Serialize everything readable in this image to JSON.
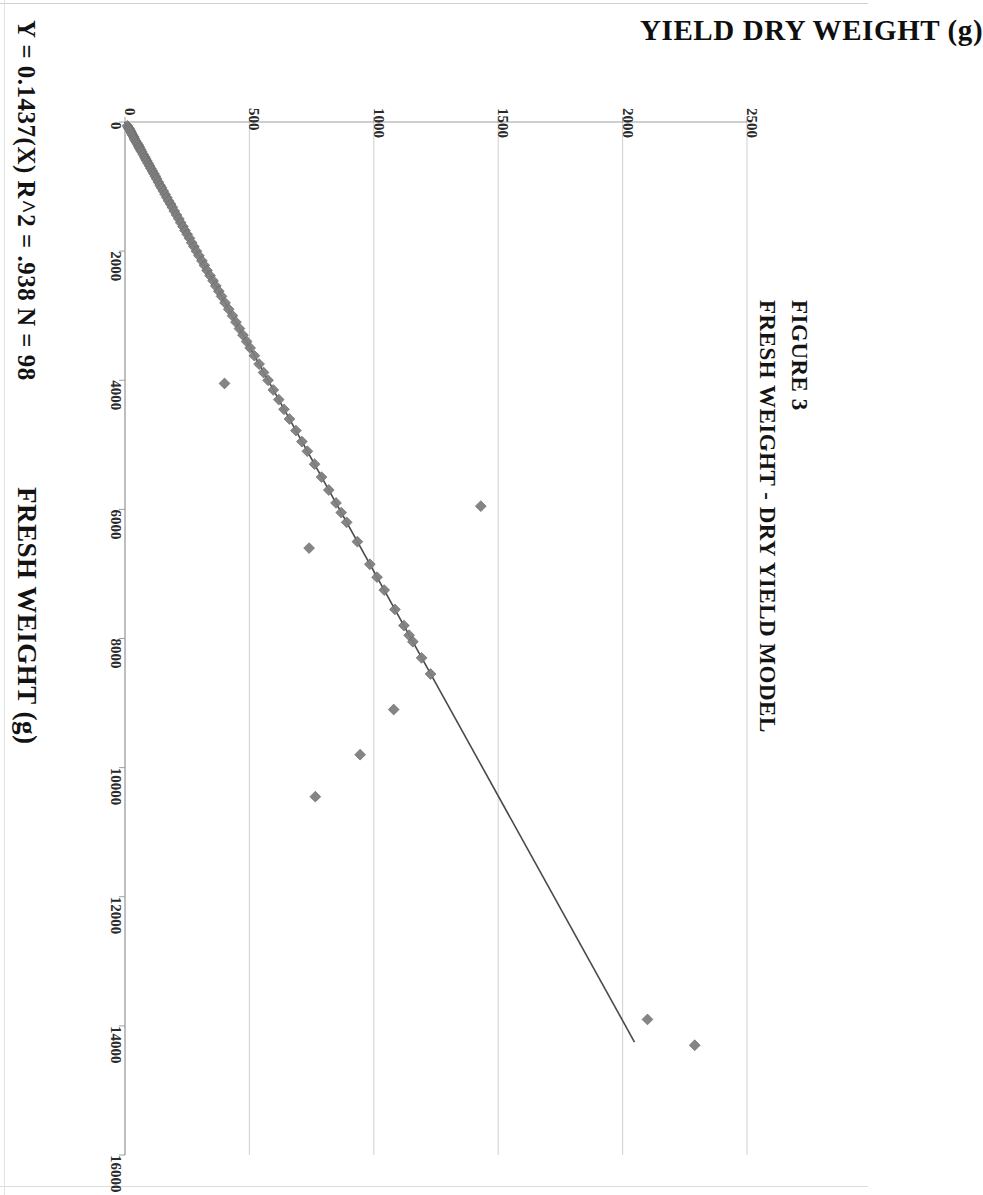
{
  "figure": {
    "number": "FIGURE 3",
    "title": "FRESH WEIGHT - DRY YIELD MODEL"
  },
  "annotation": {
    "equation": "Y = 0.1437(X)",
    "r_squared": "R^2 = .938",
    "n": "N = 98",
    "combined": "Y = 0.1437(X)    R^2 = .938   N = 98"
  },
  "axes": {
    "value_axis_title": "YIELD DRY WEIGHT (g)",
    "category_axis_title": "FRESH WEIGHT (g)",
    "value_ticks": [
      "0",
      "500",
      "1000",
      "1500",
      "2000",
      "2500"
    ],
    "category_ticks": [
      "0",
      "2000",
      "4000",
      "6000",
      "8000",
      "10000",
      "12000",
      "14000",
      "16000"
    ]
  },
  "style": {
    "marker_color": "#7e7e7e",
    "marker_edge": "#6b6b6b",
    "line_color": "#4a4a4a",
    "grid_color": "#c9c9c9",
    "axis_color": "#9e9e9e",
    "background": "#ffffff"
  },
  "chart_data": {
    "type": "scatter",
    "title": "FRESH WEIGHT - DRY YIELD MODEL",
    "subtitle": "FIGURE 3",
    "xlabel": "FRESH WEIGHT (g)",
    "ylabel": "YIELD DRY WEIGHT (g)",
    "xlim": [
      0,
      16000
    ],
    "ylim": [
      0,
      2500
    ],
    "xticks": [
      0,
      2000,
      4000,
      6000,
      8000,
      10000,
      12000,
      14000,
      16000
    ],
    "yticks": [
      0,
      500,
      1000,
      1500,
      2000,
      2500
    ],
    "grid": true,
    "legend": false,
    "orientation": "page-rotated-90-clockwise",
    "annotations": [
      "Y = 0.1437(X)",
      "R^2 = .938",
      "N = 98"
    ],
    "fit_line": {
      "type": "linear-through-origin",
      "slope": 0.1437,
      "intercept": 0,
      "r_squared": 0.938,
      "n": 98,
      "x_start": 0,
      "x_end": 14250
    },
    "series": [
      {
        "name": "samples",
        "n": 98,
        "x": [
          60,
          90,
          110,
          140,
          170,
          200,
          230,
          260,
          290,
          320,
          350,
          380,
          400,
          430,
          460,
          500,
          540,
          570,
          600,
          640,
          680,
          720,
          760,
          800,
          840,
          880,
          930,
          980,
          1020,
          1070,
          1120,
          1170,
          1220,
          1270,
          1320,
          1380,
          1440,
          1500,
          1560,
          1620,
          1680,
          1740,
          1800,
          1870,
          1930,
          2000,
          2070,
          2150,
          2220,
          2300,
          2380,
          2460,
          2540,
          2620,
          2700,
          2800,
          2900,
          3000,
          3100,
          3200,
          3300,
          3400,
          3500,
          3620,
          3750,
          3880,
          4000,
          4050,
          4150,
          4300,
          4450,
          4600,
          4780,
          4950,
          5100,
          5300,
          5500,
          5700,
          5900,
          5950,
          6050,
          6200,
          6500,
          6600,
          6850,
          7050,
          7250,
          7550,
          7800,
          7950,
          8050,
          8300,
          8550,
          9100,
          9800,
          10450,
          13900,
          14300
        ],
        "y": [
          10,
          14,
          18,
          22,
          26,
          30,
          35,
          38,
          42,
          47,
          52,
          56,
          58,
          63,
          67,
          73,
          79,
          83,
          87,
          93,
          99,
          104,
          110,
          116,
          122,
          127,
          134,
          141,
          147,
          154,
          161,
          168,
          175,
          183,
          190,
          198,
          207,
          216,
          224,
          233,
          241,
          250,
          259,
          268,
          277,
          287,
          297,
          309,
          319,
          330,
          342,
          354,
          365,
          377,
          388,
          402,
          417,
          432,
          446,
          460,
          474,
          489,
          503,
          520,
          539,
          557,
          575,
          400,
          596,
          618,
          639,
          661,
          687,
          711,
          733,
          762,
          790,
          819,
          848,
          1430,
          869,
          891,
          934,
          740,
          984,
          1013,
          1042,
          1085,
          1121,
          1142,
          1157,
          1192,
          1228,
          1080,
          945,
          765,
          2100,
          2290
        ]
      }
    ]
  }
}
